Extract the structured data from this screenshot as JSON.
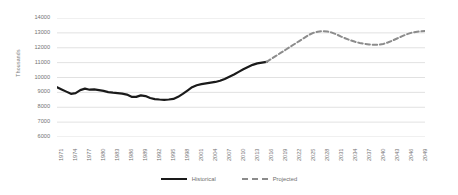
{
  "chart_data": {
    "type": "line",
    "title": "",
    "xlabel": "",
    "ylabel": "Thousands",
    "ylim": [
      6000,
      14000
    ],
    "ytick_step": 1000,
    "yticks": [
      "6000",
      "7000",
      "8000",
      "9000",
      "10000",
      "11000",
      "12000",
      "13000",
      "14000"
    ],
    "xlim": [
      1971,
      2050
    ],
    "xtick_step": 3,
    "xticks": [
      "1971",
      "1974",
      "1977",
      "1980",
      "1983",
      "1986",
      "1989",
      "1992",
      "1995",
      "1998",
      "2001",
      "2004",
      "2007",
      "2010",
      "2013",
      "2016",
      "2019",
      "2022",
      "2025",
      "2028",
      "2031",
      "2034",
      "2037",
      "2040",
      "2043",
      "2046",
      "2049"
    ],
    "grid": "horizontal",
    "legend_position": "bottom-center",
    "series": [
      {
        "name": "Historical",
        "style": "solid",
        "color": "#1a1a1a",
        "x": [
          1971,
          1972,
          1973,
          1974,
          1975,
          1976,
          1977,
          1978,
          1979,
          1980,
          1981,
          1982,
          1983,
          1984,
          1985,
          1986,
          1987,
          1988,
          1989,
          1990,
          1991,
          1992,
          1993,
          1994,
          1995,
          1996,
          1997,
          1998,
          1999,
          2000,
          2001,
          2002,
          2003,
          2004,
          2005,
          2006,
          2007,
          2008,
          2009,
          2010,
          2011,
          2012,
          2013,
          2014,
          2015,
          2016
        ],
        "values": [
          9350,
          9200,
          9050,
          8900,
          8950,
          9150,
          9250,
          9180,
          9200,
          9150,
          9100,
          9020,
          8980,
          8950,
          8920,
          8850,
          8700,
          8700,
          8800,
          8750,
          8620,
          8550,
          8520,
          8500,
          8520,
          8560,
          8700,
          8900,
          9120,
          9350,
          9480,
          9550,
          9600,
          9650,
          9700,
          9780,
          9900,
          10050,
          10200,
          10380,
          10550,
          10700,
          10850,
          10950,
          11000,
          11050
        ]
      },
      {
        "name": "Projected",
        "style": "dashed",
        "color": "#8c8c8c",
        "x": [
          2016,
          2017,
          2018,
          2019,
          2020,
          2021,
          2022,
          2023,
          2024,
          2025,
          2026,
          2027,
          2028,
          2029,
          2030,
          2031,
          2032,
          2033,
          2034,
          2035,
          2036,
          2037,
          2038,
          2039,
          2040,
          2041,
          2042,
          2043,
          2044,
          2045,
          2046,
          2047,
          2048,
          2049,
          2050
        ],
        "values": [
          11050,
          11250,
          11450,
          11650,
          11850,
          12050,
          12250,
          12450,
          12650,
          12850,
          13000,
          13080,
          13120,
          13100,
          13020,
          12900,
          12750,
          12620,
          12500,
          12400,
          12320,
          12260,
          12220,
          12200,
          12200,
          12250,
          12350,
          12480,
          12620,
          12760,
          12900,
          13000,
          13060,
          13100,
          13120
        ]
      }
    ]
  },
  "legend": {
    "items": [
      {
        "label": "Historical"
      },
      {
        "label": "Projected"
      }
    ]
  }
}
